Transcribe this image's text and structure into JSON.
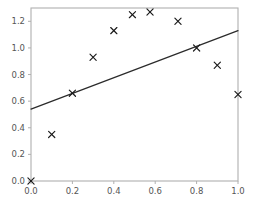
{
  "chart_data": {
    "type": "scatter",
    "title": "",
    "subtitle": "",
    "xlabel": "",
    "ylabel": "",
    "xlim": [
      0.0,
      1.0
    ],
    "ylim": [
      0.0,
      1.3
    ],
    "grid": false,
    "legend": null,
    "legend_position": "none",
    "xticks": [
      0.0,
      0.2,
      0.4,
      0.6,
      0.8,
      1.0
    ],
    "xticklabels": [
      "0.0",
      "0.2",
      "0.4",
      "0.6",
      "0.8",
      "1.0"
    ],
    "yticks": [
      0.0,
      0.2,
      0.4,
      0.6,
      0.8,
      1.0,
      1.2
    ],
    "yticklabels": [
      "0.0",
      "0.2",
      "0.4",
      "0.6",
      "0.8",
      "1.0",
      "1.2"
    ],
    "series": [
      {
        "name": "data points",
        "marker": "x",
        "color": "#1a1a1a",
        "x": [
          0.0,
          0.1,
          0.2,
          0.3,
          0.4,
          0.49,
          0.575,
          0.71,
          0.8,
          0.9,
          1.0
        ],
        "y": [
          0.0,
          0.35,
          0.66,
          0.93,
          1.13,
          1.25,
          1.27,
          1.2,
          1.0,
          0.87,
          0.65
        ]
      },
      {
        "name": "fit line",
        "marker": "none",
        "color": "#2b2b2b",
        "x": [
          0.0,
          1.0
        ],
        "y": [
          0.54,
          1.13
        ]
      }
    ],
    "annotations": []
  },
  "axes": {
    "left_spine_visible": true,
    "bottom_spine_visible": true,
    "right_spine_visible": true,
    "top_spine_visible": true,
    "spine_color": "#b0b0b0",
    "tick_label_color": "#555555"
  }
}
